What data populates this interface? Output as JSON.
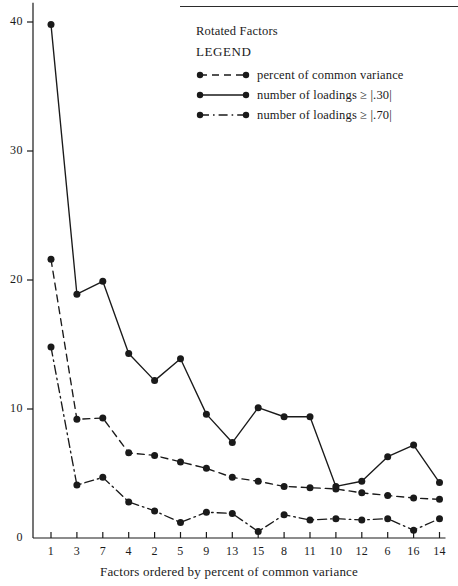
{
  "chart": {
    "type": "line",
    "heading": "Rotated Factors",
    "legend_word": "LEGEND",
    "xlabel": "Factors ordered by percent of common variance",
    "ylabel": "",
    "categories": [
      "1",
      "3",
      "7",
      "4",
      "2",
      "5",
      "9",
      "13",
      "15",
      "8",
      "11",
      "10",
      "12",
      "6",
      "16",
      "14"
    ],
    "xlim": [
      0,
      17
    ],
    "ylim": [
      0,
      41.5
    ],
    "yticks": [
      0,
      10,
      20,
      30,
      40
    ],
    "ytick_labels": [
      "0",
      "10",
      "20",
      "30",
      "40"
    ],
    "grid": false,
    "legend_position": "top-right",
    "ink": "#1a1a1a",
    "series": [
      {
        "name": "percent of common variance",
        "style": "dashed",
        "marker": "filled-circle",
        "values": [
          21.6,
          9.2,
          9.3,
          6.6,
          6.4,
          5.9,
          5.4,
          4.7,
          4.4,
          4.0,
          3.9,
          3.8,
          3.5,
          3.3,
          3.1,
          3.0
        ]
      },
      {
        "name": "number of loadings ≥ |.30|",
        "style": "solid",
        "marker": "filled-circle",
        "values": [
          39.8,
          18.9,
          19.9,
          14.3,
          12.2,
          13.9,
          9.6,
          7.4,
          10.1,
          9.4,
          9.4,
          4.0,
          4.4,
          6.3,
          7.2,
          4.3
        ]
      },
      {
        "name": "number of loadings ≥ |.70|",
        "style": "dash-dot",
        "marker": "filled-circle",
        "values": [
          14.8,
          4.1,
          4.7,
          2.8,
          2.1,
          1.2,
          2.0,
          1.9,
          0.5,
          1.8,
          1.4,
          1.5,
          1.4,
          1.5,
          0.6,
          1.5
        ]
      }
    ]
  }
}
